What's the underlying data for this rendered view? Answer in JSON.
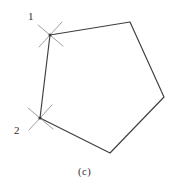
{
  "figure": {
    "caption": "(c)",
    "caption_position": {
      "x": 78,
      "y": 167
    },
    "background_color": "#ffffff",
    "line_color": "#403d3d",
    "arc_color": "#9c9a99",
    "text_color": "#2e2c2c",
    "canvas": {
      "width": 180,
      "height": 186
    },
    "shape": {
      "type": "pentagon",
      "closed": true,
      "vertices": [
        {
          "id": "v1",
          "label": "1",
          "x": 50,
          "y": 35
        },
        {
          "id": "v2",
          "label": "",
          "x": 130,
          "y": 22
        },
        {
          "id": "v3",
          "label": "",
          "x": 164,
          "y": 97
        },
        {
          "id": "v4",
          "label": "",
          "x": 110,
          "y": 153
        },
        {
          "id": "v5",
          "label": "2",
          "x": 40,
          "y": 118
        }
      ],
      "path": "M 50 35 L 130 22 L 164 97 L 110 153 L 40 118 Z"
    },
    "construction_marks": [
      {
        "name": "arc-cross-1",
        "at_vertex": "v1",
        "center": {
          "x": 50,
          "y": 35
        },
        "strokes": [
          {
            "x1": 38,
            "y1": 25,
            "x2": 63,
            "y2": 46
          },
          {
            "x1": 39,
            "y1": 47,
            "x2": 62,
            "y2": 22
          }
        ]
      },
      {
        "name": "arc-cross-2",
        "at_vertex": "v5",
        "center": {
          "x": 40,
          "y": 118
        },
        "strokes": [
          {
            "x1": 28,
            "y1": 108,
            "x2": 53,
            "y2": 129
          },
          {
            "x1": 29,
            "y1": 130,
            "x2": 52,
            "y2": 105
          }
        ]
      }
    ],
    "labels": [
      {
        "name": "vertex-label-1",
        "text": "1",
        "x": 28,
        "y": 11
      },
      {
        "name": "vertex-label-2",
        "text": "2",
        "x": 14,
        "y": 125
      }
    ]
  }
}
